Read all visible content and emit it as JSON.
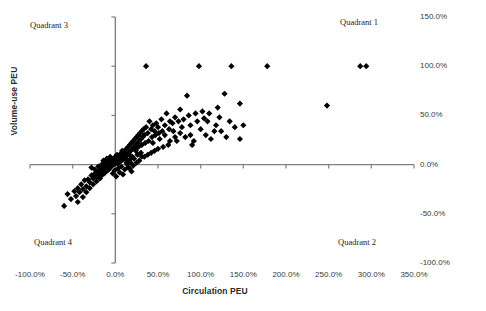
{
  "chart_data": {
    "type": "scatter",
    "title": "",
    "xlabel": "Circulation PEU",
    "ylabel": "Volume-use PEU",
    "xlim": [
      -100,
      350
    ],
    "ylim": [
      -100,
      150
    ],
    "xticks": [
      "-100.0%",
      "-50.0%",
      "0.0%",
      "50.0%",
      "100.0%",
      "150.0%",
      "200.0%",
      "250.0%",
      "300.0%",
      "350.0%"
    ],
    "xtick_values": [
      -100,
      -50,
      0,
      50,
      100,
      150,
      200,
      250,
      300,
      350
    ],
    "yticks": [
      "150.0%",
      "100.0%",
      "50.0%",
      "0.0%",
      "-50.0%",
      "-100.0%"
    ],
    "ytick_values": [
      150,
      100,
      50,
      0,
      -50,
      -100
    ],
    "grid": false,
    "legend": null,
    "marker": "diamond",
    "marker_color": "#000000",
    "annotations": [
      {
        "id": "q3",
        "text": "Quadrant 3",
        "x": -70,
        "y": 140
      },
      {
        "id": "q1",
        "text": "Quadrant 1",
        "x": 275,
        "y": 143
      },
      {
        "id": "q4",
        "text": "Quadrant 4",
        "x": -66,
        "y": -78
      },
      {
        "id": "q2",
        "text": "Quadrant 2",
        "x": 273,
        "y": -78
      }
    ],
    "points": [
      [
        36,
        100
      ],
      [
        98,
        100
      ],
      [
        136,
        100
      ],
      [
        178,
        100
      ],
      [
        287,
        100
      ],
      [
        294,
        100
      ],
      [
        248,
        60
      ],
      [
        146,
        62
      ],
      [
        128,
        72
      ],
      [
        120,
        58
      ],
      [
        84,
        70
      ],
      [
        110,
        52
      ],
      [
        96,
        44
      ],
      [
        104,
        47
      ],
      [
        88,
        40
      ],
      [
        76,
        56
      ],
      [
        70,
        48
      ],
      [
        64,
        44
      ],
      [
        60,
        52
      ],
      [
        58,
        40
      ],
      [
        54,
        46
      ],
      [
        50,
        38
      ],
      [
        48,
        42
      ],
      [
        46,
        34
      ],
      [
        44,
        40
      ],
      [
        42,
        36
      ],
      [
        40,
        44
      ],
      [
        38,
        32
      ],
      [
        36,
        38
      ],
      [
        34,
        30
      ],
      [
        33,
        36
      ],
      [
        32,
        28
      ],
      [
        31,
        34
      ],
      [
        30,
        26
      ],
      [
        29,
        32
      ],
      [
        28,
        24
      ],
      [
        27,
        30
      ],
      [
        26,
        22
      ],
      [
        25,
        28
      ],
      [
        24,
        20
      ],
      [
        23,
        26
      ],
      [
        22,
        18
      ],
      [
        21,
        24
      ],
      [
        20,
        16
      ],
      [
        19,
        22
      ],
      [
        18,
        14
      ],
      [
        17,
        20
      ],
      [
        16,
        12
      ],
      [
        15,
        18
      ],
      [
        14,
        10
      ],
      [
        13,
        16
      ],
      [
        12,
        8
      ],
      [
        11,
        14
      ],
      [
        10,
        6
      ],
      [
        9,
        12
      ],
      [
        8,
        5
      ],
      [
        7,
        10
      ],
      [
        6,
        4
      ],
      [
        5,
        8
      ],
      [
        4,
        3
      ],
      [
        3,
        6
      ],
      [
        2,
        2
      ],
      [
        1,
        5
      ],
      [
        0,
        1
      ],
      [
        -1,
        4
      ],
      [
        -2,
        0
      ],
      [
        -3,
        3
      ],
      [
        -4,
        -1
      ],
      [
        -5,
        2
      ],
      [
        -6,
        -2
      ],
      [
        -7,
        1
      ],
      [
        -8,
        -3
      ],
      [
        -9,
        0
      ],
      [
        -10,
        -4
      ],
      [
        -11,
        -1
      ],
      [
        -12,
        -5
      ],
      [
        -13,
        -2
      ],
      [
        -14,
        -6
      ],
      [
        -15,
        -3
      ],
      [
        -16,
        -8
      ],
      [
        -17,
        -5
      ],
      [
        -18,
        -10
      ],
      [
        -20,
        -7
      ],
      [
        -22,
        -12
      ],
      [
        -24,
        -9
      ],
      [
        -26,
        -14
      ],
      [
        -28,
        -11
      ],
      [
        -30,
        -18
      ],
      [
        -32,
        -15
      ],
      [
        -34,
        -22
      ],
      [
        -36,
        -16
      ],
      [
        -38,
        -25
      ],
      [
        -40,
        -20
      ],
      [
        -42,
        -28
      ],
      [
        -44,
        -24
      ],
      [
        -46,
        -32
      ],
      [
        -48,
        -27
      ],
      [
        -52,
        -35
      ],
      [
        -56,
        -30
      ],
      [
        -60,
        -42
      ],
      [
        -44,
        -38
      ],
      [
        -38,
        -33
      ],
      [
        -34,
        -28
      ],
      [
        -30,
        -24
      ],
      [
        -26,
        -20
      ],
      [
        -22,
        -17
      ],
      [
        -18,
        -14
      ],
      [
        -16,
        -11
      ],
      [
        -13,
        -9
      ],
      [
        -11,
        -7
      ],
      [
        -9,
        -6
      ],
      [
        -7,
        -4
      ],
      [
        -6,
        -3
      ],
      [
        -5,
        -1
      ],
      [
        44,
        22
      ],
      [
        52,
        26
      ],
      [
        58,
        30
      ],
      [
        62,
        20
      ],
      [
        68,
        34
      ],
      [
        72,
        24
      ],
      [
        78,
        38
      ],
      [
        82,
        28
      ],
      [
        88,
        30
      ],
      [
        92,
        24
      ],
      [
        100,
        36
      ],
      [
        106,
        30
      ],
      [
        112,
        26
      ],
      [
        118,
        40
      ],
      [
        124,
        34
      ],
      [
        130,
        28
      ],
      [
        56,
        18
      ],
      [
        50,
        16
      ],
      [
        46,
        14
      ],
      [
        42,
        12
      ],
      [
        38,
        10
      ],
      [
        34,
        8
      ],
      [
        30,
        12
      ],
      [
        26,
        10
      ],
      [
        24,
        14
      ],
      [
        20,
        8
      ],
      [
        18,
        6
      ],
      [
        16,
        10
      ],
      [
        14,
        4
      ],
      [
        12,
        12
      ],
      [
        10,
        9
      ],
      [
        8,
        14
      ],
      [
        6,
        11
      ],
      [
        4,
        7
      ],
      [
        2,
        10
      ],
      [
        0,
        8
      ],
      [
        -2,
        6
      ],
      [
        -4,
        4
      ],
      [
        22,
        6
      ],
      [
        28,
        4
      ],
      [
        18,
        2
      ],
      [
        14,
        0
      ],
      [
        -1,
        -6
      ],
      [
        3,
        -4
      ],
      [
        7,
        -2
      ],
      [
        11,
        -5
      ],
      [
        15,
        -3
      ],
      [
        19,
        -7
      ],
      [
        5,
        -8
      ],
      [
        9,
        -10
      ],
      [
        1,
        -12
      ],
      [
        -3,
        -9
      ],
      [
        23,
        16
      ],
      [
        27,
        18
      ],
      [
        31,
        20
      ],
      [
        35,
        22
      ],
      [
        39,
        24
      ],
      [
        43,
        28
      ],
      [
        47,
        30
      ],
      [
        51,
        32
      ],
      [
        55,
        34
      ],
      [
        63,
        36
      ],
      [
        67,
        42
      ],
      [
        74,
        44
      ],
      [
        80,
        46
      ],
      [
        86,
        50
      ],
      [
        94,
        52
      ],
      [
        102,
        54
      ],
      [
        31,
        8
      ],
      [
        25,
        2
      ],
      [
        21,
        -1
      ],
      [
        17,
        -4
      ],
      [
        13,
        2
      ],
      [
        7,
        4
      ],
      [
        3,
        1
      ],
      [
        -8,
        4
      ],
      [
        -12,
        2
      ],
      [
        -16,
        0
      ],
      [
        -20,
        -2
      ],
      [
        -24,
        -5
      ],
      [
        -28,
        -3
      ],
      [
        -6,
        8
      ],
      [
        -10,
        6
      ],
      [
        -14,
        4
      ],
      [
        64,
        24
      ],
      [
        70,
        28
      ],
      [
        76,
        32
      ],
      [
        90,
        20
      ],
      [
        108,
        44
      ],
      [
        116,
        34
      ],
      [
        122,
        48
      ],
      [
        134,
        44
      ],
      [
        140,
        38
      ],
      [
        150,
        40
      ],
      [
        146,
        26
      ]
    ]
  }
}
